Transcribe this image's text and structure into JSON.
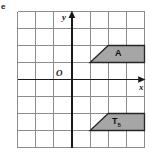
{
  "part_label": "e",
  "figure": {
    "axes": {
      "x_axis_label": "x",
      "y_axis_label": "y",
      "origin_label": "O"
    },
    "shapes": [
      {
        "name": "shape-a",
        "label": "A",
        "type": "trapezium",
        "vertices": [
          [
            1,
            2
          ],
          [
            2,
            3
          ],
          [
            4,
            3
          ],
          [
            4,
            2
          ]
        ],
        "fill": "#a6a6a6",
        "stroke": "#262626",
        "label_position": [
          3.1,
          2.45
        ]
      },
      {
        "name": "shape-t5",
        "label": "T",
        "label_sub": "5",
        "type": "trapezium",
        "vertices": [
          [
            1,
            -2
          ],
          [
            4,
            -2
          ],
          [
            4,
            -1
          ],
          [
            2,
            -1
          ]
        ],
        "fill": "#a6a6a6",
        "stroke": "#262626",
        "label_position": [
          3.05,
          -1.62
        ]
      }
    ],
    "grid": {
      "cols": 7,
      "rows": 8,
      "x_min": -3,
      "x_max": 4,
      "y_min": -4,
      "y_max": 4,
      "cell_px": 18,
      "grid_color": "#8c8c8c",
      "axis_color": "#1a1a1a",
      "background": "#ffffff"
    }
  }
}
